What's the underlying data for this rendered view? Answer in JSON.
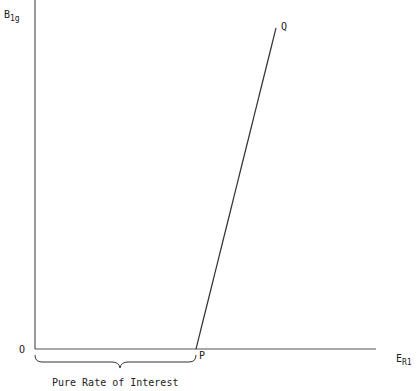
{
  "diagram": {
    "y_axis_label": {
      "main": "B",
      "sub": "1g"
    },
    "x_axis_label": {
      "main": "E",
      "sub": "R1"
    },
    "origin_label": "O",
    "point_p_label": "P",
    "point_q_label": "Q",
    "brace_caption": "Pure Rate of Interest",
    "line_color": "#333333",
    "axis_color": "#555555"
  }
}
